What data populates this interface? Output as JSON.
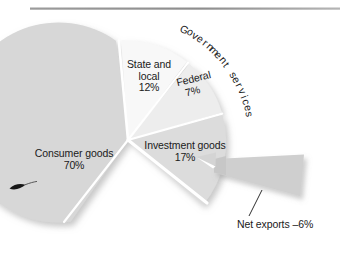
{
  "figure": {
    "width": 343,
    "height": 270,
    "background": "#ffffff",
    "rule_color": "#8a8a8a"
  },
  "chart_data": {
    "type": "pie",
    "title": "",
    "subtitle": "",
    "xlabel": "",
    "ylabel": "",
    "legend_position": "none",
    "grid": false,
    "units": "percent",
    "note": "Composition of GDP by type of expenditure; Net exports is negative and drawn as a detached wedge pointing outward.",
    "categories": [
      "Consumer goods",
      "State and local",
      "Federal",
      "Investment goods",
      "Net exports"
    ],
    "values": [
      70,
      12,
      7,
      17,
      -6
    ],
    "labels": [
      "Consumer goods 70%",
      "State and local 12%",
      "Federal 7%",
      "Investment goods 17%",
      "Net exports –6%"
    ],
    "colors": [
      "#d7d7d7",
      "#f7f7f7",
      "#ececec",
      "#dcdcdc",
      "#c9c9c9"
    ],
    "slices": [
      {
        "name": "State and local",
        "value": 12,
        "value_text": "12%",
        "label_line1": "State and",
        "label_line2": "local",
        "color": "#f7f7f7",
        "start_angle": 353,
        "end_angle": 36,
        "detached": false
      },
      {
        "name": "Federal",
        "value": 7,
        "value_text": "7%",
        "label_line1": "Federal",
        "label_line2": "",
        "color": "#ececec",
        "start_angle": 36,
        "end_angle": 62,
        "detached": false
      },
      {
        "name": "Investment goods",
        "value": 17,
        "value_text": "17%",
        "label_line1": "Investment goods",
        "label_line2": "",
        "color": "#dcdcdc",
        "start_angle": 62,
        "end_angle": 118,
        "detached": false
      },
      {
        "name": "Consumer goods",
        "value": 70,
        "value_text": "70%",
        "label_line1": "Consumer goods",
        "label_line2": "",
        "color": "#d7d7d7",
        "start_angle": 125,
        "end_angle": 353,
        "detached": false
      },
      {
        "name": "Net exports",
        "value": -6,
        "value_text": "–6%",
        "label_line1": "Net exports –6%",
        "label_line2": "",
        "color": "#c9c9c9",
        "start_angle": 96,
        "end_angle": 118,
        "detached": true
      }
    ],
    "group_annotation": {
      "text": "Government services",
      "covers": [
        "State and local",
        "Federal"
      ],
      "style": "curved-arc"
    }
  },
  "labels": {
    "consumer_goods": {
      "line1": "Consumer goods",
      "line2": "70%"
    },
    "state_local": {
      "line1": "State and",
      "line2": "local",
      "line3": "12%"
    },
    "federal": {
      "line1": "Federal",
      "line2": "7%"
    },
    "investment_goods": {
      "line1": "Investment goods",
      "line2": "17%"
    },
    "net_exports": {
      "line1": "Net exports –6%"
    },
    "government_services": {
      "text": "Government services"
    }
  }
}
